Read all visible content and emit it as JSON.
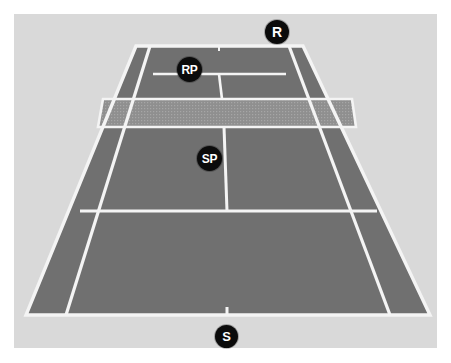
{
  "diagram": {
    "kind": "tennis-court-doubles-positions",
    "view": "perspective-behind-baseline",
    "surface_color": "#707070",
    "line_color": "#f4f4f4",
    "surround_color": "#d9d9d9",
    "page_color": "#ffffff",
    "net_color": "#8d8d8d",
    "marker_fill": "#0b0b0b",
    "marker_text_color": "#ffffff"
  },
  "markers": [
    {
      "id": "r",
      "label": "R",
      "name": "receiver"
    },
    {
      "id": "rp",
      "label": "RP",
      "name": "receivers-partner"
    },
    {
      "id": "sp",
      "label": "SP",
      "name": "servers-partner"
    },
    {
      "id": "s",
      "label": "S",
      "name": "server"
    }
  ],
  "court_lines": {
    "doubles_boundary": "136,46 303,46 430,315 26,315",
    "far_baseline": "136,46 303,46",
    "near_baseline": "26,315 430,315",
    "left_doubles_sideline": "136,46 26,315",
    "right_doubles_sideline": "303,46 430,315",
    "left_singles_sideline": "150,46 66,315",
    "right_singles_sideline": "289,46 390,315",
    "far_service_line": "153,74 286,74",
    "near_service_line": "80,211 377,211",
    "center_service_line": "219,74 227,211",
    "near_center_mark": "227,308 227,315",
    "far_center_mark": "219,46 219,52",
    "net_band": "103,99 352,99 356,127 98,127",
    "net_top_edge": "103,99 352,99",
    "net_bottom_edge": "98,127 356,127"
  }
}
